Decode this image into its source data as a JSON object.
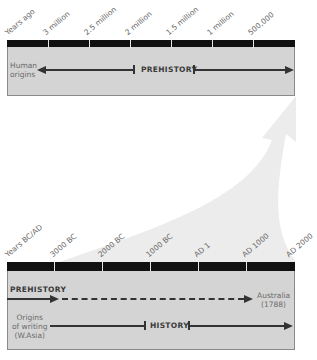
{
  "top_timeline": {
    "tick_labels": [
      "Years ago",
      "3 million",
      "2.5 million",
      "2 million",
      "1.5 million",
      "1 million",
      "500,000"
    ],
    "start_label": "Human origins",
    "start_label_lines": [
      "Human",
      "origins"
    ],
    "era_label": "PREHISTORY"
  },
  "bottom_timeline": {
    "tick_labels": [
      "Years BC/AD",
      "3000 BC",
      "2000 BC",
      "1000 BC",
      "AD 1",
      "AD 1000",
      "AD 2000"
    ],
    "prehistory_label": "PREHISTORY",
    "end_label_lines": [
      "Australia",
      "(1788)"
    ],
    "writing_label_lines": [
      "Origins",
      "of writing",
      "(W.Asia)"
    ],
    "era_label": "HISTORY"
  },
  "colors": {
    "bar": "#111111",
    "box_fill": "#d4d4d4",
    "zoom_arrow": "#ececec",
    "line": "#333333"
  }
}
